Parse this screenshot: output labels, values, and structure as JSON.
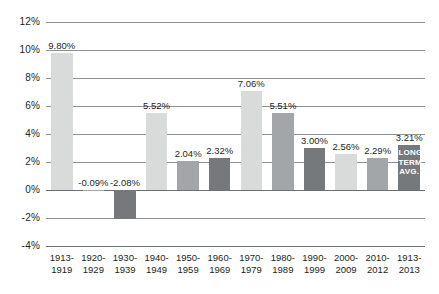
{
  "chart_data": {
    "type": "bar",
    "title": "",
    "subtitle": "",
    "xlabel": "",
    "ylabel": "",
    "ylim": [
      -4,
      12
    ],
    "ytick_step": 2,
    "yticks": [
      "12%",
      "10%",
      "8%",
      "6%",
      "4%",
      "2%",
      "0%",
      "-2%",
      "-4%"
    ],
    "ytick_values": [
      12,
      10,
      8,
      6,
      4,
      2,
      0,
      -2,
      -4
    ],
    "grid": true,
    "legend": "none",
    "categories": [
      "1913-1919",
      "1920-1929",
      "1930-1939",
      "1940-1949",
      "1950-1959",
      "1960-1969",
      "1970-1979",
      "1980-1989",
      "1990-1999",
      "2000-2009",
      "2010-2012",
      "1913-2013"
    ],
    "category_lines": [
      [
        "1913-",
        "1919"
      ],
      [
        "1920-",
        "1929"
      ],
      [
        "1930-",
        "1939"
      ],
      [
        "1940-",
        "1949"
      ],
      [
        "1950-",
        "1959"
      ],
      [
        "1960-",
        "1969"
      ],
      [
        "1970-",
        "1979"
      ],
      [
        "1980-",
        "1989"
      ],
      [
        "1990-",
        "1999"
      ],
      [
        "2000-",
        "2009"
      ],
      [
        "2010-",
        "2012"
      ],
      [
        "1913-",
        "2013"
      ]
    ],
    "values": [
      9.8,
      -0.09,
      -2.08,
      5.52,
      2.04,
      2.32,
      7.06,
      5.51,
      3.0,
      2.56,
      2.29,
      3.21
    ],
    "data_labels": [
      "9.80%",
      "-0.09%",
      "-2.08%",
      "5.52%",
      "2.04%",
      "2.32%",
      "7.06%",
      "5.51%",
      "3.00%",
      "2.56%",
      "2.29%",
      "3.21%"
    ],
    "bar_shades": [
      "light",
      "mid",
      "dark",
      "light",
      "mid",
      "dark",
      "light",
      "mid",
      "dark",
      "light",
      "mid",
      "dark"
    ],
    "annotations": [
      {
        "category": "1913-2013",
        "lines": [
          "LONG",
          "TERM",
          "AVG."
        ],
        "placement": "inside-bar"
      }
    ]
  },
  "colors": {
    "bar_light": "#d9dbdb",
    "bar_mid": "#a2a6a8",
    "bar_dark": "#76797b",
    "gridline": "#8d9196",
    "axis": "#6b7075",
    "text": "#231f20",
    "inbar_text": "#ffffff",
    "background": "#ffffff"
  },
  "annotation_text": {
    "line1": "LONG",
    "line2": "TERM",
    "line3": "AVG."
  }
}
